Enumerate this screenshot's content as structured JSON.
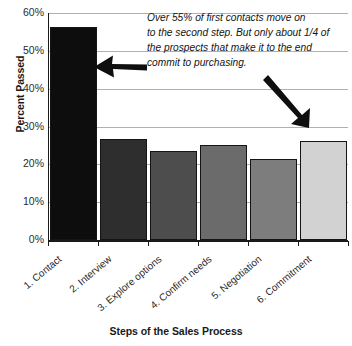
{
  "chart_data": {
    "type": "bar",
    "title": "",
    "xlabel": "Steps of the Sales Process",
    "ylabel": "Percent Passed",
    "categories": [
      "1. Contact",
      "2. Interview",
      "3. Explore options",
      "4. Confirm needs",
      "5. Negotiation",
      "6. Commitment"
    ],
    "values": [
      56.3,
      26.8,
      23.6,
      25.1,
      21.3,
      26.3
    ],
    "value_labels": [
      "56.3%",
      "26.8%",
      "23.6%",
      "25.1%",
      "21.3%",
      "26.3%"
    ],
    "bar_colors": [
      "#0d0d0d",
      "#2e2e2e",
      "#4d4d4d",
      "#6b6b6b",
      "#7d7d7d",
      "#d2d2d2"
    ],
    "ylim": [
      0,
      60
    ],
    "ytick_labels": [
      "0%",
      "10%",
      "20%",
      "30%",
      "40%",
      "50%",
      "60%"
    ],
    "ytick_values": [
      0,
      10,
      20,
      30,
      40,
      50,
      60
    ],
    "grid": true,
    "legend": "none",
    "annotations": [
      {
        "name": "callout-text",
        "lines": [
          "Over 55% of first contacts move on",
          "to the second step. But only about 1/4 of",
          "the prospects that make it to the end",
          "commit to purchasing."
        ]
      },
      {
        "name": "arrow-to-first-bar",
        "direction": "left",
        "target_category": "1. Contact"
      },
      {
        "name": "arrow-to-last-bar",
        "direction": "down-right",
        "target_category": "6. Commitment"
      }
    ]
  },
  "axis": {
    "y_title": "Percent Passed",
    "x_title": "Steps of the Sales Process"
  }
}
